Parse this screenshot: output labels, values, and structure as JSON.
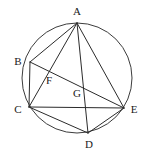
{
  "figure": {
    "stroke_color": "#2b2b2b",
    "circle_color": "#3c3c3c",
    "background_color": "#ffffff",
    "label_color": "#1a1a1a"
  },
  "circle": {
    "name": "circumscribed-circle",
    "cx": 77,
    "cy": 78,
    "r": 55
  },
  "points": [
    {
      "id": "A",
      "label": "A",
      "x": 77,
      "y": 23,
      "label_x": 77,
      "label_y": 15,
      "on_circle": true
    },
    {
      "id": "B",
      "label": "B",
      "x": 30,
      "y": 62,
      "label_x": 18,
      "label_y": 65,
      "on_circle": true
    },
    {
      "id": "C",
      "label": "C",
      "x": 29,
      "y": 107,
      "label_x": 18,
      "label_y": 113,
      "on_circle": true
    },
    {
      "id": "D",
      "label": "D",
      "x": 88,
      "y": 133,
      "label_x": 89,
      "label_y": 148,
      "on_circle": true
    },
    {
      "id": "E",
      "label": "E",
      "x": 124,
      "y": 108,
      "label_x": 134,
      "label_y": 113,
      "on_circle": true
    },
    {
      "id": "F",
      "label": "F",
      "x": 53,
      "y": 72,
      "label_x": 49,
      "label_y": 84,
      "on_circle": false
    },
    {
      "id": "G",
      "label": "G",
      "x": 81,
      "y": 85,
      "label_x": 77,
      "label_y": 97,
      "on_circle": false
    }
  ],
  "chords": [
    {
      "id": "AB",
      "from": "A",
      "to": "B",
      "x1": 77,
      "y1": 23,
      "x2": 30,
      "y2": 62
    },
    {
      "id": "AC",
      "from": "A",
      "to": "C",
      "x1": 77,
      "y1": 23,
      "x2": 29,
      "y2": 107
    },
    {
      "id": "AD",
      "from": "A",
      "to": "D",
      "x1": 77,
      "y1": 23,
      "x2": 88,
      "y2": 133
    },
    {
      "id": "AE",
      "from": "A",
      "to": "E",
      "x1": 77,
      "y1": 23,
      "x2": 124,
      "y2": 108
    },
    {
      "id": "BC",
      "from": "B",
      "to": "C",
      "x1": 30,
      "y1": 62,
      "x2": 29,
      "y2": 107
    },
    {
      "id": "BE",
      "from": "B",
      "to": "E",
      "x1": 30,
      "y1": 62,
      "x2": 124,
      "y2": 108
    },
    {
      "id": "CD",
      "from": "C",
      "to": "D",
      "x1": 29,
      "y1": 107,
      "x2": 88,
      "y2": 133
    },
    {
      "id": "CE",
      "from": "C",
      "to": "E",
      "x1": 29,
      "y1": 107,
      "x2": 124,
      "y2": 108
    },
    {
      "id": "DE",
      "from": "D",
      "to": "E",
      "x1": 88,
      "y1": 133,
      "x2": 124,
      "y2": 108
    }
  ],
  "intersections": [
    {
      "id": "F",
      "of": "AC x BE"
    },
    {
      "id": "G",
      "of": "AD x BE"
    }
  ]
}
